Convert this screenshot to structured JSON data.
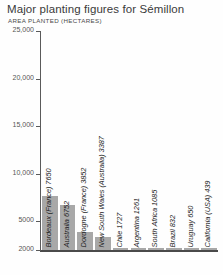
{
  "chart_data": {
    "type": "bar",
    "title": "Major planting figures for Sémillon",
    "subtitle": "AREA PLANTED (HECTARES)",
    "xlabel": "",
    "ylabel": "AREA PLANTED (HECTARES)",
    "ylim": [
      2000,
      25000
    ],
    "y_ticks": [
      "25,000",
      "20,000",
      "15,000",
      "10,000",
      "5000",
      "2000"
    ],
    "y_tick_values": [
      25000,
      20000,
      15000,
      10000,
      5000,
      2000
    ],
    "grid": false,
    "legend": "none",
    "bar_color": "#a8a8a8",
    "axis_color": "#5a5a5a",
    "categories": [
      "Bordeaux (France)",
      "Australia",
      "Dordogne (France)",
      "New South Wales (Australia)",
      "Chile",
      "Argentina",
      "South Africa",
      "Brazil",
      "Uruguay",
      "California (USA)"
    ],
    "values": [
      7650,
      6752,
      3852,
      3387,
      1727,
      1261,
      1085,
      832,
      650,
      439
    ],
    "bar_labels": [
      "Bordeaux (France) 7650",
      "Australia 6752",
      "Dordogne (France) 3852",
      "New South Wales (Australia) 3387",
      "Chile 1727",
      "Argentina 1261",
      "South Africa 1085",
      "Brazil 832",
      "Uruguay 650",
      "California (USA) 439"
    ]
  }
}
